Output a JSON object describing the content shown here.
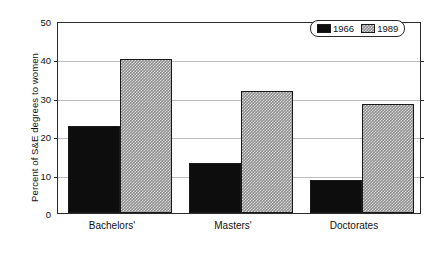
{
  "chart_data": {
    "type": "bar",
    "title": "",
    "xlabel": "",
    "ylabel": "Percent of S&E degrees to women",
    "categories": [
      "Bachelors'",
      "Masters'",
      "Doctorates"
    ],
    "series": [
      {
        "name": "1966",
        "values": [
          22.8,
          13.2,
          8.7
        ],
        "color": "#0d0d0d",
        "fill": "solid-black"
      },
      {
        "name": "1989",
        "values": [
          40.4,
          32.0,
          28.7
        ],
        "color": "#8f8f8f",
        "fill": "checkerboard-gray"
      }
    ],
    "ylim": [
      0,
      50
    ],
    "yticks": [
      50,
      40,
      30,
      20,
      10,
      0
    ],
    "ytick_labels": [
      "50",
      "40",
      "30",
      "20",
      "10",
      "0"
    ],
    "grid": true,
    "grid_axis": "y",
    "legend_position": "top-right",
    "legend_entries": [
      "1966",
      "1989"
    ]
  }
}
